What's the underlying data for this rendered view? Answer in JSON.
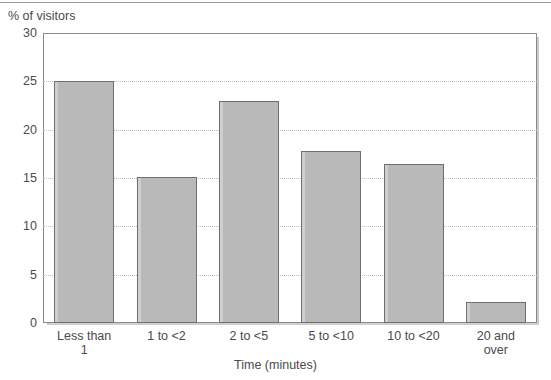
{
  "chart_data": {
    "type": "bar",
    "title": "",
    "subtitle": "",
    "xlabel": "Time (minutes)",
    "ylabel": "% of visitors",
    "categories": [
      "Less than 1",
      "1 to <2",
      "2 to <5",
      "5 to <10",
      "10 to <20",
      "20 and over"
    ],
    "category_lines": [
      [
        "Less than",
        "1"
      ],
      [
        "1 to <2"
      ],
      [
        "2 to <5"
      ],
      [
        "5 to <10"
      ],
      [
        "10 to <20"
      ],
      [
        "20 and",
        "over"
      ]
    ],
    "values": [
      25.0,
      15.1,
      23.0,
      17.8,
      16.5,
      2.2
    ],
    "ylim": [
      0,
      30
    ],
    "yticks": [
      0,
      5,
      10,
      15,
      20,
      25,
      30
    ],
    "ytick_labels": [
      "0",
      "5",
      "10",
      "15",
      "20",
      "25",
      "30"
    ],
    "grid": "horizontal-dotted",
    "legend": "none",
    "bar_fill": "#b9b9b9",
    "bar_border": "#6f6f6f",
    "gridline_color": "#bdbdbd",
    "axis_color": "#8a8a8a",
    "text_color": "#4a4a4a",
    "background": "#ffffff"
  }
}
